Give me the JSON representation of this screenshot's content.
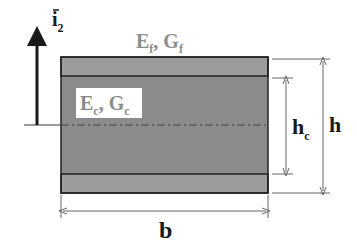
{
  "diagram": {
    "axis_label": {
      "symbol": "i",
      "subscript": "2"
    },
    "face_label": {
      "E": "E",
      "E_sub": "f",
      "sep": ", ",
      "G": "G",
      "G_sub": "f"
    },
    "core_label": {
      "E": "E",
      "E_sub": "c",
      "sep": ", ",
      "G": "G",
      "G_sub": "c"
    },
    "dimensions": {
      "core_height": {
        "symbol": "h",
        "subscript": "c"
      },
      "total_height": {
        "symbol": "h"
      },
      "width": {
        "symbol": "b"
      }
    },
    "colors": {
      "face": "#9a9a9a",
      "core": "#8a8a8a",
      "outline": "#222222",
      "face_label": "#8e8e8e",
      "text": "#1a1a1a"
    }
  }
}
